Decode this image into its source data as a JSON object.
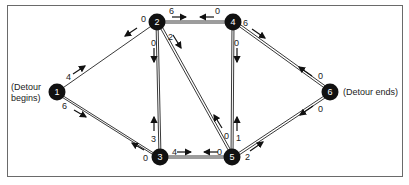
{
  "diagram": {
    "cut_caption": "",
    "start_label_line1": "(Detour",
    "start_label_line2": "begins)",
    "end_label": "(Detour ends)",
    "nodes": [
      {
        "id": "1",
        "x": 57,
        "y": 92
      },
      {
        "id": "2",
        "x": 157,
        "y": 22
      },
      {
        "id": "3",
        "x": 160,
        "y": 157
      },
      {
        "id": "4",
        "x": 233,
        "y": 22
      },
      {
        "id": "5",
        "x": 232,
        "y": 157
      },
      {
        "id": "6",
        "x": 330,
        "y": 92
      }
    ],
    "edges": [
      {
        "from": "1",
        "to": "2",
        "flow_forward": "4",
        "flow_back": "0"
      },
      {
        "from": "1",
        "to": "3",
        "flow_forward": "6",
        "flow_back": "0"
      },
      {
        "from": "2",
        "to": "4",
        "flow_forward": "6",
        "flow_back": "0"
      },
      {
        "from": "2",
        "to": "3",
        "flow_forward": "0",
        "flow_back": "3"
      },
      {
        "from": "2",
        "to": "5",
        "flow_forward": "2",
        "flow_back": "0"
      },
      {
        "from": "3",
        "to": "5",
        "flow_forward": "4",
        "flow_back": "0"
      },
      {
        "from": "4",
        "to": "5",
        "flow_forward": "0",
        "flow_back": "1"
      },
      {
        "from": "4",
        "to": "6",
        "flow_forward": "6",
        "flow_back": "0"
      },
      {
        "from": "5",
        "to": "6",
        "flow_forward": "2",
        "flow_back": "0"
      }
    ],
    "flow_labels": {
      "e12_fwd": "4",
      "e12_back": "0",
      "e13_fwd": "6",
      "e13_back": "0",
      "e24_fwd": "6",
      "e24_back": "0",
      "e23_fwd": "0",
      "e23_back": "3",
      "e25_fwd": "2",
      "e25_back": "0",
      "e35_fwd": "4",
      "e35_back": "0",
      "e45_fwd": "0",
      "e45_back": "1",
      "e46_fwd": "6",
      "e46_back": "0",
      "e56_fwd": "2",
      "e56_back": "0"
    }
  }
}
